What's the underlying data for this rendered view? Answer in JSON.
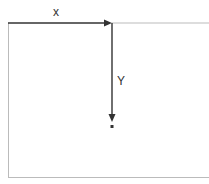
{
  "diagram": {
    "x_label": "x",
    "y_label": "Y",
    "colors": {
      "axis": "#333333",
      "frame": "#bbbbbb",
      "background": "#ffffff"
    },
    "origin": [
      8,
      23
    ],
    "point": [
      112,
      126
    ]
  }
}
